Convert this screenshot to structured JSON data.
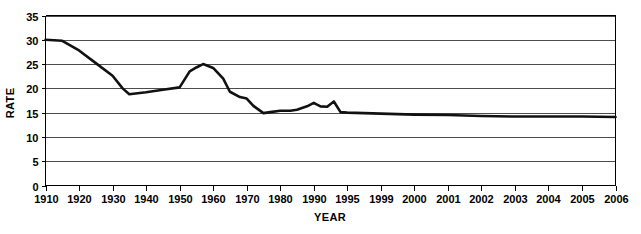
{
  "chart_data": {
    "type": "line",
    "title": "",
    "xlabel": "YEAR",
    "ylabel": "RATE",
    "ylim": [
      0,
      35
    ],
    "ytick_step": 5,
    "yticks": [
      "0",
      "5",
      "10",
      "15",
      "20",
      "25",
      "30",
      "35"
    ],
    "grid": true,
    "legend": "none",
    "line_color": "#111111",
    "xtick_labels": [
      "1910",
      "1920",
      "1930",
      "1940",
      "1950",
      "1960",
      "1970",
      "1980",
      "1990",
      "1995",
      "1999",
      "2000",
      "2001",
      "2002",
      "2003",
      "2004",
      "2005",
      "2006"
    ],
    "x": [
      1910,
      1915,
      1920,
      1925,
      1930,
      1933,
      1935,
      1940,
      1945,
      1950,
      1953,
      1955,
      1957,
      1960,
      1963,
      1965,
      1968,
      1970,
      1972,
      1975,
      1977,
      1980,
      1983,
      1985,
      1988,
      1990,
      1991,
      1992,
      1993,
      1994,
      1995,
      1999,
      2000,
      2001,
      2002,
      2003,
      2004,
      2005,
      2006
    ],
    "values": [
      30.0,
      29.8,
      27.8,
      25.2,
      22.6,
      20.0,
      18.8,
      19.2,
      19.7,
      20.2,
      23.5,
      24.3,
      25.0,
      24.2,
      22.0,
      19.3,
      18.2,
      17.9,
      16.4,
      14.9,
      15.1,
      15.4,
      15.4,
      15.6,
      16.3,
      17.0,
      16.3,
      16.2,
      17.3,
      15.1,
      15.0,
      14.8,
      14.6,
      14.5,
      14.3,
      14.2,
      14.2,
      14.2,
      14.1
    ]
  },
  "axes": {
    "y_title": "RATE",
    "x_title": "YEAR"
  }
}
